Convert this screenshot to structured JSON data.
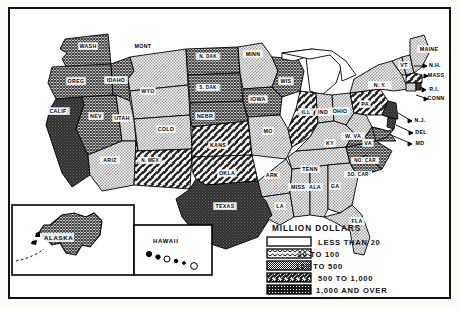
{
  "map": {
    "title_visible": false,
    "legend": {
      "title": "MILLION DOLLARS",
      "items": [
        {
          "pattern": "blank",
          "label": "LESS THAN 20"
        },
        {
          "pattern": "wavy",
          "label": "20 TO 100"
        },
        {
          "pattern": "stipple",
          "label": "100 TO 500"
        },
        {
          "pattern": "diagonal",
          "label": "500 TO 1,000"
        },
        {
          "pattern": "solid-dark",
          "label": "1,000 AND OVER"
        }
      ]
    },
    "insets": [
      {
        "name": "alaska",
        "label": "ALASKA"
      },
      {
        "name": "hawaii",
        "label": "HAWAII"
      }
    ],
    "states": [
      {
        "abbr": "WASH",
        "class": "crosshatch",
        "x": 78,
        "y": 38
      },
      {
        "abbr": "OREG",
        "class": "crosshatch",
        "x": 66,
        "y": 73
      },
      {
        "abbr": "CALIF",
        "class": "dark",
        "x": 48,
        "y": 103
      },
      {
        "abbr": "NEV",
        "class": "crosshatch",
        "x": 86,
        "y": 108
      },
      {
        "abbr": "IDAHO",
        "class": "crosshatch",
        "x": 106,
        "y": 72
      },
      {
        "abbr": "MONT",
        "class": "stipple",
        "x": 133,
        "y": 38
      },
      {
        "abbr": "WYO",
        "class": "stipple",
        "x": 138,
        "y": 83
      },
      {
        "abbr": "UTAH",
        "class": "stipple",
        "x": 112,
        "y": 110
      },
      {
        "abbr": "ARIZ",
        "class": "stipple",
        "x": 100,
        "y": 152
      },
      {
        "abbr": "COLO",
        "class": "stipple",
        "x": 156,
        "y": 121
      },
      {
        "abbr": "N. MEX",
        "class": "diagonal",
        "x": 140,
        "y": 152
      },
      {
        "abbr": "N. DAK",
        "class": "crosshatch",
        "x": 198,
        "y": 48
      },
      {
        "abbr": "S. DAK",
        "class": "crosshatch",
        "x": 198,
        "y": 79
      },
      {
        "abbr": "NEBR",
        "class": "crosshatch",
        "x": 195,
        "y": 108
      },
      {
        "abbr": "KANS",
        "class": "diagonal",
        "x": 208,
        "y": 137
      },
      {
        "abbr": "OKLA",
        "class": "diagonal",
        "x": 217,
        "y": 165
      },
      {
        "abbr": "TEXAS",
        "class": "dark",
        "x": 215,
        "y": 198
      },
      {
        "abbr": "MINN",
        "class": "stipple",
        "x": 243,
        "y": 46
      },
      {
        "abbr": "IOWA",
        "class": "crosshatch",
        "x": 248,
        "y": 91
      },
      {
        "abbr": "MO",
        "class": "stipple",
        "x": 258,
        "y": 123
      },
      {
        "abbr": "ARK",
        "class": "stipple",
        "x": 262,
        "y": 167
      },
      {
        "abbr": "LA",
        "class": "stipple",
        "x": 270,
        "y": 198
      },
      {
        "abbr": "WIS",
        "class": "crosshatch",
        "x": 276,
        "y": 73
      },
      {
        "abbr": "ILL",
        "class": "diagonal",
        "x": 296,
        "y": 104
      },
      {
        "abbr": "IND",
        "class": "stipple",
        "x": 313,
        "y": 104
      },
      {
        "abbr": "OHIO",
        "class": "stipple",
        "x": 330,
        "y": 103
      },
      {
        "abbr": "MISS",
        "class": "stipple",
        "x": 288,
        "y": 179
      },
      {
        "abbr": "ALA",
        "class": "stipple",
        "x": 305,
        "y": 179
      },
      {
        "abbr": "TENN",
        "class": "stipple",
        "x": 300,
        "y": 161
      },
      {
        "abbr": "KY",
        "class": "stipple",
        "x": 320,
        "y": 135
      },
      {
        "abbr": "GA",
        "class": "stipple",
        "x": 325,
        "y": 178
      },
      {
        "abbr": "FLA",
        "class": "stipple",
        "x": 347,
        "y": 213
      },
      {
        "abbr": "SO. CAR",
        "class": "crosshatch",
        "x": 348,
        "y": 166
      },
      {
        "abbr": "NO. CAR",
        "class": "crosshatch",
        "x": 355,
        "y": 152
      },
      {
        "abbr": "W. VA",
        "class": "stipple",
        "x": 343,
        "y": 128
      },
      {
        "abbr": "VA",
        "class": "crosshatch",
        "x": 358,
        "y": 135
      },
      {
        "abbr": "PA",
        "class": "diagonal",
        "x": 355,
        "y": 96
      },
      {
        "abbr": "N. Y.",
        "class": "stipple",
        "x": 370,
        "y": 77
      },
      {
        "abbr": "VT",
        "class": "stipple",
        "x": 394,
        "y": 57
      },
      {
        "abbr": "MAINE",
        "class": "stipple",
        "x": 419,
        "y": 41
      },
      {
        "abbr": "N.H.",
        "class": "callout",
        "x": 425,
        "y": 57
      },
      {
        "abbr": "MASS",
        "class": "callout",
        "x": 426,
        "y": 67
      },
      {
        "abbr": "R.I.",
        "class": "callout",
        "x": 424,
        "y": 81
      },
      {
        "abbr": "CONN",
        "class": "callout",
        "x": 426,
        "y": 90
      },
      {
        "abbr": "N.J.",
        "class": "callout",
        "x": 410,
        "y": 112
      },
      {
        "abbr": "DEL",
        "class": "callout",
        "x": 411,
        "y": 124
      },
      {
        "abbr": "MD",
        "class": "callout",
        "x": 410,
        "y": 135
      }
    ]
  },
  "colors": {
    "ink": "#111111",
    "paper": "#ffffff",
    "stipple": "#b5b5b5",
    "crosshatch": "#6e6e6e",
    "dark": "#2b2b2b"
  }
}
